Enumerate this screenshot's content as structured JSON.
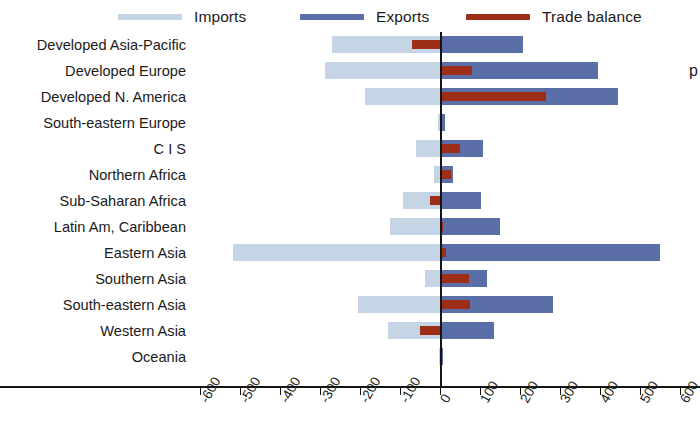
{
  "legend": {
    "items": [
      {
        "label": "Imports",
        "color": "#c5d5e6",
        "name": "imports"
      },
      {
        "label": "Exports",
        "color": "#5a6fa8",
        "name": "exports"
      },
      {
        "label": "Trade balance",
        "color": "#9e2d18",
        "name": "trade-balance"
      }
    ]
  },
  "side_note": "p",
  "chart_data": {
    "type": "bar",
    "orientation": "horizontal",
    "title": "",
    "subtitle": "",
    "xlabel": "",
    "ylabel": "",
    "xlim": [
      -600,
      600
    ],
    "xticks": [
      -600,
      -500,
      -400,
      -300,
      -200,
      -100,
      0,
      100,
      200,
      300,
      400,
      500,
      600
    ],
    "xtick_labels": [
      "-600",
      "-500",
      "-400",
      "-300",
      "-200",
      "-100",
      "0",
      "100",
      "200",
      "300",
      "400",
      "500",
      "600"
    ],
    "grid": false,
    "legend_position": "top",
    "zero_reference_line": 0,
    "categories": [
      "Developed Asia-Pacific",
      "Developed Europe",
      "Developed N. America",
      "South-eastern Europe",
      "C I S",
      "Northern Africa",
      "Sub-Saharan Africa",
      "Latin Am, Caribbean",
      "Eastern Asia",
      "Southern Asia",
      "South-eastern Asia",
      "Western Asia",
      "Oceania"
    ],
    "series": [
      {
        "name": "Imports",
        "color": "#c5d5e6",
        "values": [
          -272,
          -290,
          -190,
          -8,
          -63,
          -18,
          -95,
          -128,
          -520,
          -40,
          -208,
          -132,
          -4
        ]
      },
      {
        "name": "Exports",
        "color": "#5a6fa8",
        "values": [
          205,
          392,
          443,
          10,
          105,
          30,
          100,
          148,
          548,
          115,
          280,
          133,
          6
        ]
      },
      {
        "name": "Trade balance",
        "color": "#9e2d18",
        "values": [
          -73,
          78,
          262,
          2,
          48,
          25,
          -28,
          6,
          14,
          70,
          72,
          -52,
          2
        ]
      }
    ]
  }
}
